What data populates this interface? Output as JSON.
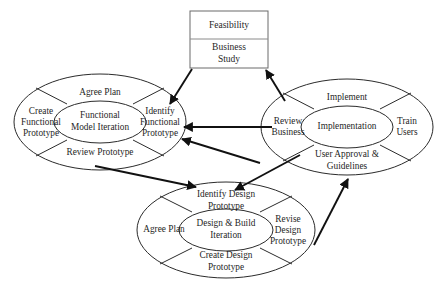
{
  "diagram": {
    "type": "process-cycle-diagram",
    "colors": {
      "background": "#ffffff",
      "outline": "#2b2b2b",
      "box_outline": "#6a6a6a",
      "arrow": "#111111",
      "text": "#1f1f1f"
    },
    "phase_box": {
      "name": "pre-project-phases",
      "rows": [
        {
          "label": "Feasibility"
        },
        {
          "label": "Business\nStudy",
          "line1": "Business",
          "line2": "Study"
        }
      ]
    },
    "cycles": [
      {
        "id": "functional-model-iteration",
        "center_label": "Functional\nModel Iteration",
        "center_line1": "Functional",
        "center_line2": "Model Iteration",
        "segments": [
          {
            "position": "top",
            "label": "Agree Plan"
          },
          {
            "position": "left",
            "label": "Create\nFunctional\nPrototype",
            "line1": "Create",
            "line2": "Functional",
            "line3": "Prototype"
          },
          {
            "position": "right",
            "label": "Identify\nFunctional\nPrototype",
            "line1": "Identify",
            "line2": "Functional",
            "line3": "Prototype"
          },
          {
            "position": "bottom",
            "label": "Review Prototype"
          }
        ]
      },
      {
        "id": "implementation",
        "center_label": "Implementation",
        "center_line1": "Implementation",
        "segments": [
          {
            "position": "top",
            "label": "Implement"
          },
          {
            "position": "left",
            "label": "Review\nBusiness",
            "line1": "Review",
            "line2": "Business"
          },
          {
            "position": "right",
            "label": "Train\nUsers",
            "line1": "Train",
            "line2": "Users"
          },
          {
            "position": "bottom",
            "label": "User Approval &\nGuidelines",
            "line1": "User Approval &",
            "line2": "Guidelines"
          }
        ]
      },
      {
        "id": "design-and-build-iteration",
        "center_label": "Design & Build\nIteration",
        "center_line1": "Design & Build",
        "center_line2": "Iteration",
        "segments": [
          {
            "position": "top",
            "label": "Identify Design\nPrototype",
            "line1": "Identify Design",
            "line2": "Prototype"
          },
          {
            "position": "left",
            "label": "Agree Plan"
          },
          {
            "position": "right",
            "label": "Revise\nDesign\nPrototype",
            "line1": "Revise",
            "line2": "Design",
            "line3": "Prototype"
          },
          {
            "position": "bottom",
            "label": "Create Design\nPrototype",
            "line1": "Create Design",
            "line2": "Prototype"
          }
        ]
      }
    ],
    "connections": [
      {
        "from": "business-study",
        "to": "identify-functional-prototype",
        "style": "solid-arrow"
      },
      {
        "from": "review-business",
        "to": "business-study",
        "style": "solid-arrow"
      },
      {
        "from": "review-business",
        "to": "identify-functional-prototype",
        "style": "solid-arrow"
      },
      {
        "from": "identify-design-prototype-area",
        "to": "identify-functional-prototype",
        "style": "solid-arrow"
      },
      {
        "from": "functional-model-iteration",
        "to": "identify-design-prototype",
        "style": "solid-arrow"
      },
      {
        "from": "review-business",
        "to": "identify-design-prototype",
        "style": "solid-arrow"
      },
      {
        "from": "revise-design-prototype",
        "to": "user-approval-guidelines",
        "style": "solid-arrow"
      }
    ]
  }
}
